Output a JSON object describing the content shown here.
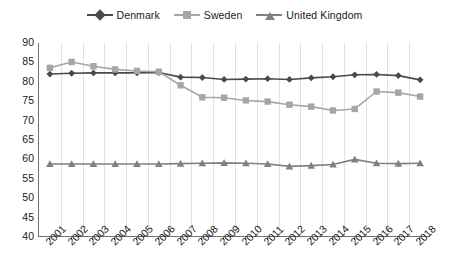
{
  "chart_data": {
    "type": "line",
    "title": "",
    "subtitle": "",
    "xlabel": "",
    "ylabel": "",
    "ylim": [
      40,
      90
    ],
    "yticks": [
      40,
      45,
      50,
      55,
      60,
      65,
      70,
      75,
      80,
      85,
      90
    ],
    "grid": "vertical",
    "legend_position": "top-center",
    "categories": [
      "2001",
      "2002",
      "2003",
      "2004",
      "2005",
      "2006",
      "2007",
      "2008",
      "2009",
      "2010",
      "2011",
      "2012",
      "2013",
      "2014",
      "2015",
      "2016",
      "2017",
      "2018"
    ],
    "series": [
      {
        "name": "Denmark",
        "color": "#4a4a4a",
        "marker": "diamond",
        "values": [
          82.0,
          82.2,
          82.3,
          82.3,
          82.3,
          82.4,
          81.2,
          81.1,
          80.6,
          80.7,
          80.8,
          80.6,
          81.0,
          81.3,
          81.8,
          81.9,
          81.6,
          80.5
        ]
      },
      {
        "name": "Sweden",
        "color": "#a6a6a6",
        "marker": "square",
        "values": [
          83.6,
          85.1,
          84.0,
          83.2,
          82.8,
          82.6,
          79.1,
          76.0,
          75.9,
          75.2,
          74.9,
          74.1,
          73.6,
          72.6,
          73.0,
          77.5,
          77.2,
          76.2
        ]
      },
      {
        "name": "United Kingdom",
        "color": "#808080",
        "marker": "triangle",
        "values": [
          58.8,
          58.8,
          58.8,
          58.8,
          58.8,
          58.8,
          58.9,
          59.0,
          59.1,
          59.0,
          58.8,
          58.2,
          58.4,
          58.7,
          60.0,
          59.0,
          58.9,
          59.0
        ]
      }
    ]
  },
  "legend": {
    "items": [
      {
        "label": "Denmark"
      },
      {
        "label": "Sweden"
      },
      {
        "label": "United Kingdom"
      }
    ]
  },
  "colors": {
    "denmark": "#4a4a4a",
    "sweden": "#a6a6a6",
    "uk": "#808080",
    "axis": "#6f6f6f",
    "grid": "#e2e2e2",
    "text": "#1a1a1a",
    "background": "#ffffff"
  }
}
